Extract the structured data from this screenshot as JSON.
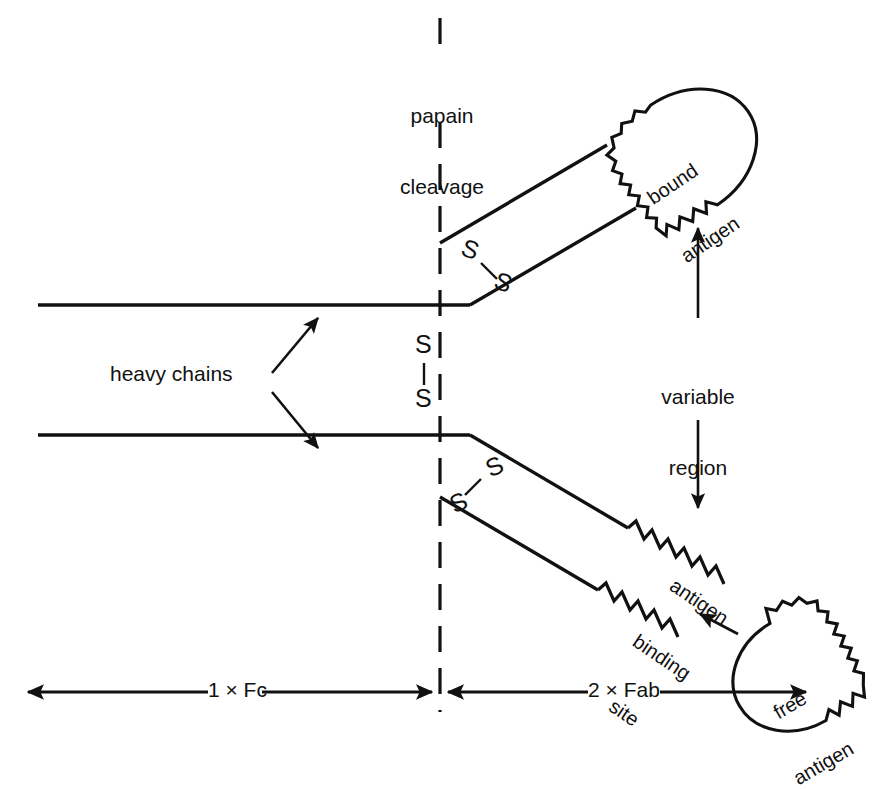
{
  "figure": {
    "type": "schematic-diagram",
    "background_color": "#ffffff",
    "line_color": "#111111",
    "width": 889,
    "height": 749
  },
  "labels": {
    "papain_cleavage_line1": "papain",
    "papain_cleavage_line2": "cleavage",
    "heavy_chains": "heavy chains",
    "variable_region_line1": "variable",
    "variable_region_line2": "region",
    "antigen_binding_line1": "antigen",
    "antigen_binding_line2": "binding",
    "antigen_binding_line3": "site",
    "bound_antigen_line1": "bound",
    "bound_antigen_line2": "antigen",
    "free_antigen_line1": "free",
    "free_antigen_line2": "antigen",
    "fc_measure": "1 × Fc",
    "fab_measure": "2 × Fab",
    "sulfur": "S"
  },
  "disulfide_bonds": [
    {
      "name": "upper-hinge-disulfide",
      "s_top": "S",
      "s_bottom": "S",
      "orientation": "diagonal"
    },
    {
      "name": "center-hinge-disulfide",
      "s_top": "S",
      "s_bottom": "S",
      "orientation": "vertical"
    },
    {
      "name": "lower-hinge-disulfide",
      "s_top": "S",
      "s_bottom": "S",
      "orientation": "diagonal"
    }
  ],
  "regions": [
    {
      "name": "Fc",
      "label": "1 × Fc",
      "count": 1
    },
    {
      "name": "Fab",
      "label": "2 × Fab",
      "count": 2
    }
  ],
  "antigens": [
    {
      "name": "bound-antigen",
      "label": "bound antigen",
      "state": "bound"
    },
    {
      "name": "free-antigen",
      "label": "free antigen",
      "state": "free"
    }
  ]
}
